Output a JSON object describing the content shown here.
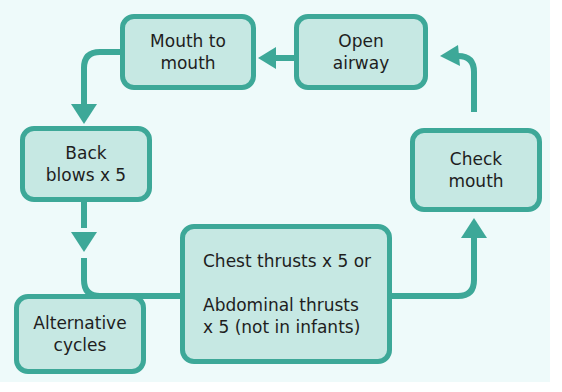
{
  "diagram": {
    "title": "",
    "nodes": [
      {
        "id": "mouth-to-mouth",
        "lines": [
          "Mouth to",
          "mouth"
        ]
      },
      {
        "id": "open-airway",
        "lines": [
          "Open",
          "airway"
        ]
      },
      {
        "id": "back-blows",
        "lines": [
          "Back",
          "blows x 5"
        ]
      },
      {
        "id": "check-mouth",
        "lines": [
          "Check",
          "mouth"
        ]
      },
      {
        "id": "chest-abdominal-thrusts",
        "lines": [
          "Chest thrusts x 5 or",
          "Abdominal thrusts",
          "x 5 (not in infants)"
        ]
      },
      {
        "id": "alternative-cycles",
        "lines": [
          "Alternative",
          "cycles"
        ]
      }
    ],
    "edges": [
      {
        "from": "open-airway",
        "to": "mouth-to-mouth"
      },
      {
        "from": "mouth-to-mouth",
        "to": "back-blows"
      },
      {
        "from": "back-blows",
        "to": "chest-abdominal-thrusts"
      },
      {
        "from": "chest-abdominal-thrusts",
        "to": "check-mouth"
      },
      {
        "from": "check-mouth",
        "to": "open-airway"
      },
      {
        "from": "alternative-cycles",
        "to": "back-blows/chest-abdominal-thrusts connector"
      }
    ],
    "colors": {
      "background": "#eefafa",
      "box_fill": "#c6e8e3",
      "box_border": "#3da898",
      "arrow": "#3da898",
      "text": "#1e1e1e"
    }
  }
}
